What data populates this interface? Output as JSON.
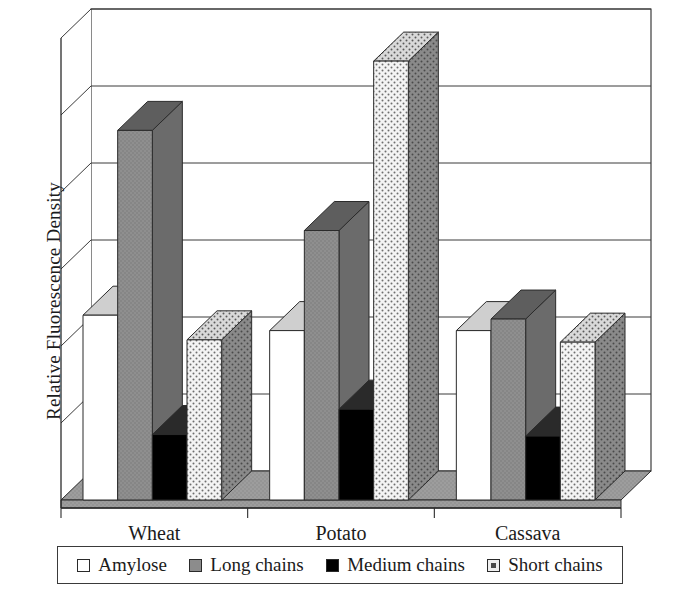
{
  "chart_data": {
    "type": "bar",
    "title": "",
    "subtitle": "",
    "xlabel": "",
    "ylabel": "Relative Fluorescence Density",
    "categories": [
      "Wheat",
      "Potato",
      "Cassava"
    ],
    "series": [
      {
        "name": "Amylose",
        "swatch": "white",
        "color": "#ffffff",
        "values": [
          2.4,
          2.2,
          2.2
        ]
      },
      {
        "name": "Long chains",
        "swatch": "gray",
        "color": "#8c8c8c",
        "values": [
          4.8,
          3.5,
          2.35
        ]
      },
      {
        "name": "Medium chains",
        "swatch": "black",
        "color": "#000000",
        "values": [
          0.85,
          1.18,
          0.83
        ]
      },
      {
        "name": "Short chains",
        "swatch": "dotted-light",
        "color": "#f2f2f2",
        "values": [
          2.08,
          5.7,
          2.05
        ]
      }
    ],
    "ylim": [
      0,
      6
    ],
    "y_tick_count": 6,
    "y_tick_labels": [],
    "grid": true,
    "grid_axis": "y",
    "legend_position": "bottom",
    "style": "3d-column",
    "annotations": []
  },
  "axis": {
    "y_title": "Relative Fluorescence Density",
    "category_labels": [
      "Wheat",
      "Potato",
      "Cassava"
    ]
  },
  "legend": {
    "entries": [
      {
        "label": "Amylose",
        "swatch_name": "legend-swatch-amylose"
      },
      {
        "label": "Long chains",
        "swatch_name": "legend-swatch-long-chains"
      },
      {
        "label": "Medium chains",
        "swatch_name": "legend-swatch-medium-chains"
      },
      {
        "label": "Short chains",
        "swatch_name": "legend-swatch-short-chains"
      }
    ]
  },
  "colors": {
    "amylose": "#ffffff",
    "long_chains": "#8c8c8c",
    "medium_chains": "#000000",
    "short_chains": "#f2f2f2",
    "floor": "#9a9a9a",
    "outline": "#2b2b2b",
    "gridline": "#3a3a3a"
  }
}
